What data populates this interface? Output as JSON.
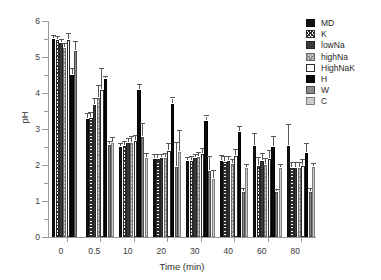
{
  "chart_data": {
    "type": "bar",
    "title": "",
    "xlabel": "Time (min)",
    "ylabel": "pH",
    "categories": [
      "0",
      "0.5",
      "10",
      "20",
      "30",
      "40",
      "60",
      "80"
    ],
    "ylim": [
      0,
      6
    ],
    "yticks": [
      0,
      1,
      2,
      3,
      4,
      5,
      6
    ],
    "ytick_labels": [
      "0",
      "1",
      "2",
      "3",
      "4",
      "5",
      "6"
    ],
    "grid": false,
    "legend_position": "top-right",
    "errorbars": "standard deviation",
    "series": [
      {
        "name": "MD",
        "swatch": "#131313",
        "values": [
          5.49,
          3.29,
          2.49,
          2.18,
          2.1,
          2.11,
          2.52,
          2.52
        ],
        "errors": [
          0.06,
          0.1,
          0.07,
          0.08,
          0.06,
          0.12,
          0.3,
          0.55
        ]
      },
      {
        "name": "K",
        "swatch": "#ffffff",
        "values": [
          5.47,
          3.3,
          2.52,
          2.17,
          2.12,
          2.07,
          1.98,
          1.92
        ],
        "errors": [
          0.07,
          0.11,
          0.09,
          0.09,
          0.07,
          0.12,
          0.2,
          0.12
        ]
      },
      {
        "name": "lowNa",
        "swatch": "#39393b",
        "values": [
          5.38,
          3.68,
          2.62,
          2.19,
          2.19,
          2.11,
          2.12,
          1.92
        ],
        "errors": [
          0.06,
          0.12,
          0.07,
          0.07,
          0.06,
          0.08,
          0.17,
          0.1
        ]
      },
      {
        "name": "highNa",
        "swatch": "#d2d2d2",
        "values": [
          5.26,
          3.85,
          2.62,
          2.19,
          2.22,
          2.03,
          2.01,
          1.93
        ],
        "errors": [
          0.06,
          0.31,
          0.12,
          0.1,
          0.09,
          0.07,
          0.12,
          0.1
        ]
      },
      {
        "name": "HighNaK",
        "swatch": "#ffffff",
        "values": [
          5.46,
          4.09,
          2.67,
          2.4,
          2.3,
          2.25,
          2.18,
          1.98
        ],
        "errors": [
          0.14,
          0.55,
          0.11,
          0.16,
          0.13,
          0.13,
          0.18,
          0.14
        ]
      },
      {
        "name": "H",
        "swatch": "#0b0b0b",
        "values": [
          4.49,
          4.38,
          4.08,
          3.69,
          3.22,
          2.91,
          2.5,
          2.33
        ],
        "errors": [
          0.15,
          0.05,
          0.12,
          0.13,
          0.1,
          0.12,
          0.25,
          0.22
        ]
      },
      {
        "name": "W",
        "swatch": "#8a8a8a",
        "values": [
          5.17,
          2.55,
          2.79,
          1.94,
          1.82,
          1.25,
          1.24,
          1.26
        ],
        "errors": [
          0.22,
          0.07,
          0.33,
          0.65,
          0.38,
          0.05,
          0.05,
          0.05
        ]
      },
      {
        "name": "C",
        "swatch": "#cdcdcd",
        "values": [
          null,
          2.62,
          2.2,
          2.36,
          1.62,
          1.93,
          1.93,
          1.95
        ],
        "errors": [
          null,
          0.11,
          0.07,
          0.55,
          0.18,
          0.04,
          0.04,
          0.04
        ]
      }
    ]
  },
  "legend": {
    "items": [
      {
        "label": "MD"
      },
      {
        "label": "K"
      },
      {
        "label": "lowNa"
      },
      {
        "label": "highNa"
      },
      {
        "label": "HighNaK"
      },
      {
        "label": "H"
      },
      {
        "label": "W"
      },
      {
        "label": "C"
      }
    ]
  }
}
